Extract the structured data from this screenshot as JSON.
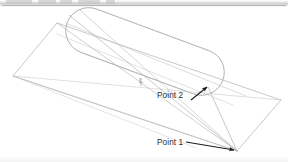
{
  "figure": {
    "kind": "line-drawing",
    "background_color": "#ffffff",
    "stroke_color_light": "#b9b9b9",
    "stroke_color_medium": "#9a9a9a",
    "stroke_color_dark": "#1a1a1a",
    "annotations": [
      {
        "id": "point1",
        "label": "Point 1",
        "label_x": 157,
        "label_y": 138,
        "arrow_from_x": 186,
        "arrow_from_y": 142,
        "arrow_to_x": 236,
        "arrow_to_y": 150,
        "arrow_color": "#1a1a1a"
      },
      {
        "id": "point2",
        "label": "Point 2",
        "label_x": 157,
        "label_y": 91,
        "arrow_from_x": 191,
        "arrow_from_y": 100,
        "arrow_to_x": 209,
        "arrow_to_y": 86,
        "arrow_color": "#1a1a1a"
      },
      {
        "id": "length",
        "label": "L",
        "label_x": 139,
        "label_y": 76,
        "color": "#8d8d8d"
      }
    ],
    "plane": {
      "name": "ground-parallelogram",
      "vertices": [
        {
          "x": 57,
          "y": 23
        },
        {
          "x": 281,
          "y": 100
        },
        {
          "x": 237,
          "y": 151
        },
        {
          "x": 13,
          "y": 76
        }
      ]
    },
    "capsule": {
      "name": "stadium-tube",
      "axis_start_x": 68,
      "axis_start_y": 23,
      "axis_end_x": 222,
      "axis_end_y": 80,
      "radius": 23
    },
    "rays": [
      {
        "from": [
          13,
          76
        ],
        "to": [
          237,
          151
        ]
      },
      {
        "from": [
          13,
          76
        ],
        "to": [
          281,
          100
        ]
      },
      {
        "from": [
          237,
          151
        ],
        "to": [
          57,
          23
        ]
      },
      {
        "from": [
          237,
          151
        ],
        "to": [
          68,
          14
        ]
      },
      {
        "from": [
          237,
          151
        ],
        "to": [
          78,
          8
        ]
      },
      {
        "from": [
          237,
          151
        ],
        "to": [
          207,
          86
        ]
      },
      {
        "from": [
          68,
          23
        ],
        "to": [
          245,
          95
        ]
      },
      {
        "from": [
          58,
          33
        ],
        "to": [
          232,
          104
        ]
      }
    ]
  },
  "scan_artifacts": {
    "top_band": true,
    "top_rule": true,
    "ghost_marks": [
      {
        "left": 6,
        "width": 26
      },
      {
        "left": 38,
        "width": 18
      },
      {
        "left": 60,
        "width": 12
      },
      {
        "left": 78,
        "width": 22
      },
      {
        "left": 106,
        "width": 9
      }
    ]
  }
}
